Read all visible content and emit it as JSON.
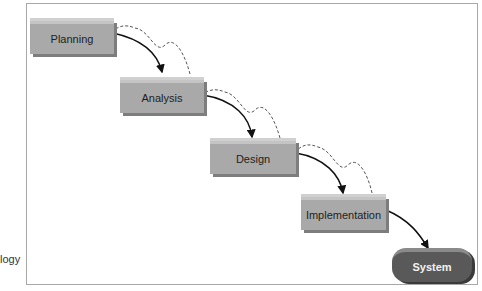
{
  "caption_fragment": "logy",
  "stages": [
    {
      "label": "Planning"
    },
    {
      "label": "Analysis"
    },
    {
      "label": "Design"
    },
    {
      "label": "Implementation"
    }
  ],
  "output": {
    "label": "System"
  }
}
